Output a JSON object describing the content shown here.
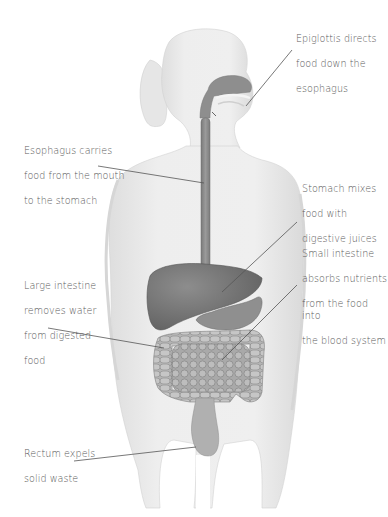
{
  "diagram": {
    "colors": {
      "background": "#ffffff",
      "body_silhouette": "#ececec",
      "body_shadow": "#dcdcdc",
      "organ_dark": "#6f6f6f",
      "organ_mid": "#8a8a8a",
      "organ_light": "#a4a4a4",
      "leader_line": "#555555",
      "label_text": "#5a5a5a"
    },
    "labels": [
      {
        "id": "epiglottis",
        "lines": [
          "Epiglottis directs",
          "food down the",
          "esophagus"
        ]
      },
      {
        "id": "esophagus",
        "lines": [
          "Esophagus carries",
          "food from the mouth",
          "to the stomach"
        ]
      },
      {
        "id": "stomach",
        "lines": [
          "Stomach mixes",
          "food with",
          "digestive juices"
        ]
      },
      {
        "id": "large-intestine",
        "lines": [
          "Large intestine",
          "removes water",
          "from digested",
          "food"
        ]
      },
      {
        "id": "small-intestine",
        "lines": [
          "Small intestine",
          "absorbs nutrients",
          "from the food into",
          "the blood system"
        ]
      },
      {
        "id": "rectum",
        "lines": [
          "Rectum expels",
          "solid waste"
        ]
      }
    ]
  }
}
